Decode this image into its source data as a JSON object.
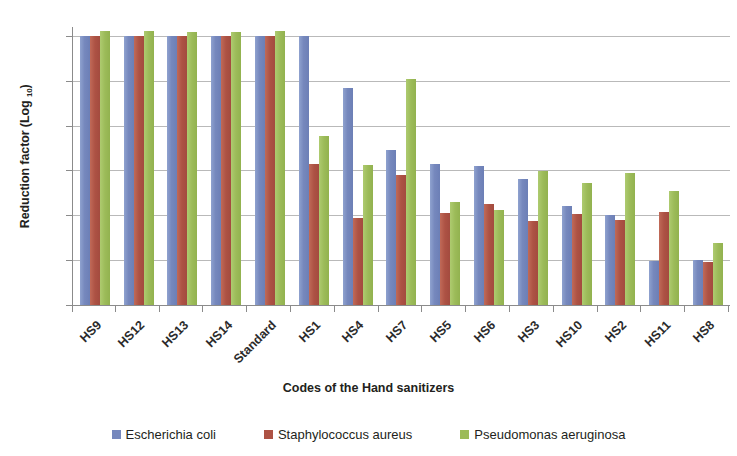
{
  "chart_data": {
    "type": "bar",
    "title": "",
    "xlabel": "Codes of the Hand sanitizers",
    "ylabel": "Reduction factor (Log 10)",
    "ylabel_main": "Reduction factor (Log ",
    "ylabel_sub": "10",
    "ylabel_tail": ")",
    "ylim": [
      0,
      6.2
    ],
    "grid": true,
    "legend_position": "bottom",
    "categories": [
      "HS9",
      "HS12",
      "HS13",
      "HS14",
      "Standard",
      "HS1",
      "HS4",
      "HS7",
      "HS5",
      "HS6",
      "HS3",
      "HS10",
      "HS2",
      "HS11",
      "HS8"
    ],
    "y_ticks": [
      "0.00",
      "1.00",
      "2.00",
      "3.00",
      "4.00",
      "5.00",
      "6.00"
    ],
    "y_tick_values": [
      0,
      1,
      2,
      3,
      4,
      5,
      6
    ],
    "series": [
      {
        "name": "Escherichia coli",
        "color": "#7688bd",
        "values": [
          6.0,
          6.0,
          6.0,
          6.0,
          6.0,
          6.0,
          4.85,
          3.45,
          3.15,
          3.1,
          2.8,
          2.2,
          2.0,
          0.98,
          1.0
        ]
      },
      {
        "name": "Staphylococcus aureus",
        "color": "#ad5244",
        "values": [
          6.0,
          6.0,
          6.0,
          6.0,
          6.0,
          3.15,
          1.93,
          2.9,
          2.05,
          2.25,
          1.88,
          2.03,
          1.9,
          2.08,
          0.95
        ]
      },
      {
        "name": "Pseudomonas aeruginosa",
        "color": "#9cbb59",
        "values": [
          6.1,
          6.1,
          6.08,
          6.08,
          6.1,
          3.78,
          3.13,
          5.05,
          2.3,
          2.13,
          2.98,
          2.72,
          2.95,
          2.55,
          1.38
        ]
      }
    ]
  }
}
